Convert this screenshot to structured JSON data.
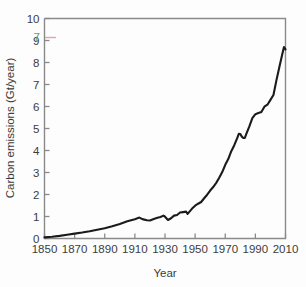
{
  "figure": {
    "background_color": "#fdfdfd",
    "frame_color": "#8a8a8a",
    "line_color": "#1b1b1b",
    "text_color": "#3c3c3c"
  },
  "axes": {
    "x_title": "Year",
    "y_title": "Carbon emissions (Gt/year)",
    "x_ticks": [
      "1850",
      "1870",
      "1890",
      "1910",
      "1930",
      "1950",
      "1970",
      "1990",
      "2010"
    ],
    "y_ticks": [
      "0",
      "1",
      "2",
      "3",
      "4",
      "5",
      "6",
      "7",
      "8",
      "9",
      "10"
    ]
  },
  "artifact": {
    "label": "7",
    "color": "#5aa06a",
    "tick_color": "#e8a0ad",
    "note": "stray scanned tick label between 9 and 10"
  },
  "chart_data": {
    "type": "line",
    "title": "",
    "subtitle": "",
    "xlabel": "Year",
    "ylabel": "Carbon emissions (Gt/year)",
    "xlim": [
      1850,
      2010
    ],
    "ylim": [
      0,
      10
    ],
    "xticks": [
      1850,
      1870,
      1890,
      1910,
      1930,
      1950,
      1970,
      1990,
      2010
    ],
    "yticks": [
      0,
      1,
      2,
      3,
      4,
      5,
      6,
      7,
      8,
      9,
      10
    ],
    "grid": false,
    "legend": null,
    "series": [
      {
        "name": "Global carbon emissions",
        "color": "#1b1b1b",
        "x": [
          1850,
          1855,
          1860,
          1865,
          1870,
          1875,
          1880,
          1885,
          1890,
          1895,
          1900,
          1905,
          1910,
          1913,
          1915,
          1918,
          1920,
          1923,
          1925,
          1927,
          1929,
          1930,
          1932,
          1934,
          1936,
          1938,
          1940,
          1942,
          1944,
          1945,
          1946,
          1948,
          1950,
          1952,
          1954,
          1956,
          1958,
          1960,
          1962,
          1964,
          1966,
          1968,
          1970,
          1972,
          1974,
          1976,
          1978,
          1979,
          1980,
          1981,
          1982,
          1983,
          1984,
          1986,
          1988,
          1990,
          1992,
          1994,
          1996,
          1998,
          2000,
          2002,
          2004,
          2006,
          2008,
          2009,
          2010
        ],
        "y": [
          0.05,
          0.08,
          0.12,
          0.17,
          0.22,
          0.27,
          0.33,
          0.4,
          0.47,
          0.56,
          0.66,
          0.78,
          0.88,
          0.95,
          0.88,
          0.83,
          0.82,
          0.9,
          0.94,
          0.98,
          1.04,
          0.99,
          0.84,
          0.92,
          1.04,
          1.07,
          1.18,
          1.2,
          1.22,
          1.12,
          1.2,
          1.36,
          1.49,
          1.58,
          1.66,
          1.83,
          1.99,
          2.18,
          2.34,
          2.53,
          2.76,
          3.02,
          3.35,
          3.61,
          3.97,
          4.24,
          4.57,
          4.76,
          4.75,
          4.63,
          4.57,
          4.57,
          4.76,
          5.1,
          5.47,
          5.65,
          5.7,
          5.75,
          5.99,
          6.08,
          6.3,
          6.52,
          7.2,
          7.82,
          8.42,
          8.7,
          8.6
        ]
      }
    ],
    "annotations": [
      {
        "text": "7",
        "x_desc": "left of axis between 9 and 10",
        "type": "scan-artifact",
        "color": "#5aa06a"
      }
    ]
  }
}
